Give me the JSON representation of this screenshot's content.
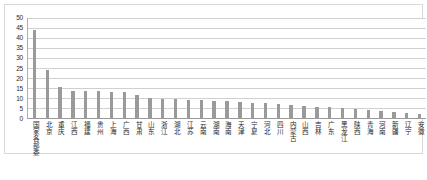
{
  "chart_data": {
    "type": "bar",
    "title": "",
    "subtitle": "",
    "xlabel": "",
    "ylabel": "",
    "ylim": [
      0,
      50
    ],
    "ytick_step": 5,
    "yticks": [
      0,
      5,
      10,
      15,
      20,
      25,
      30,
      35,
      40,
      45,
      50
    ],
    "grid": true,
    "legend": false,
    "legend_position": "none",
    "bar_color": "#9a9a9a",
    "categories": [
      "国家各部委",
      "北京",
      "重庆",
      "江西",
      "福建",
      "贵州",
      "上海",
      "广西",
      "甘肃",
      "山东",
      "浙江",
      "湖北",
      "江苏",
      "云南",
      "湖南",
      "海南",
      "天津",
      "宁夏",
      "河北",
      "四川",
      "内蒙古",
      "山西",
      "吉林",
      "广东",
      "黑龙江",
      "陕西",
      "青海",
      "河南",
      "新疆",
      "辽宁",
      "安徽"
    ],
    "values": [
      44,
      24.5,
      16,
      14,
      14,
      14,
      13.5,
      13.5,
      12,
      10.5,
      10,
      10,
      9.5,
      9.5,
      9,
      9,
      8.5,
      8,
      8,
      7.5,
      7,
      6.5,
      6,
      6,
      5.5,
      5,
      4.5,
      4,
      3.5,
      3,
      2.5
    ]
  }
}
